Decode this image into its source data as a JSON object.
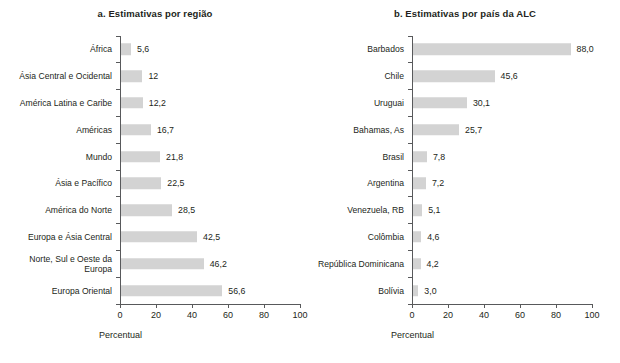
{
  "chart_data": [
    {
      "type": "bar",
      "orientation": "horizontal",
      "panel_label": "a.",
      "title": "a. Estimativas por região",
      "xlabel": "Percentual",
      "ylabel": "",
      "xlim": [
        0,
        100
      ],
      "xticks": [
        0,
        20,
        40,
        60,
        80,
        100
      ],
      "xtick_labels": [
        "0",
        "20",
        "40",
        "60",
        "80",
        "100"
      ],
      "grid": false,
      "legend": false,
      "bar_color": "#d3d3d3",
      "categories": [
        "África",
        "Ásia Central e Ocidental",
        "América Latina e Caribe",
        "Américas",
        "Mundo",
        "Ásia e Pacífico",
        "América do Norte",
        "Europa e Ásia Central",
        "Norte, Sul e Oeste da\nEuropa",
        "Europa Oriental"
      ],
      "values": [
        5.6,
        12,
        12.2,
        16.7,
        21.8,
        22.5,
        28.5,
        42.5,
        46.2,
        56.6
      ],
      "value_labels": [
        "5,6",
        "12",
        "12,2",
        "16,7",
        "21,8",
        "22,5",
        "28,5",
        "42,5",
        "46,2",
        "56,6"
      ]
    },
    {
      "type": "bar",
      "orientation": "horizontal",
      "panel_label": "b.",
      "title": "b. Estimativas por país da ALC",
      "xlabel": "Percentual",
      "ylabel": "",
      "xlim": [
        0,
        100
      ],
      "xticks": [
        0,
        20,
        40,
        60,
        80,
        100
      ],
      "xtick_labels": [
        "0",
        "20",
        "40",
        "60",
        "80",
        "100"
      ],
      "grid": false,
      "legend": false,
      "bar_color": "#d3d3d3",
      "categories": [
        "Barbados",
        "Chile",
        "Uruguai",
        "Bahamas, As",
        "Brasil",
        "Argentina",
        "Venezuela, RB",
        "Colômbia",
        "República Dominicana",
        "Bolívia"
      ],
      "values": [
        88.0,
        45.6,
        30.1,
        25.7,
        7.8,
        7.2,
        5.1,
        4.6,
        4.2,
        3.0
      ],
      "value_labels": [
        "88,0",
        "45,6",
        "30,1",
        "25,7",
        "7,8",
        "7,2",
        "5,1",
        "4,6",
        "4,2",
        "3,0"
      ]
    }
  ]
}
